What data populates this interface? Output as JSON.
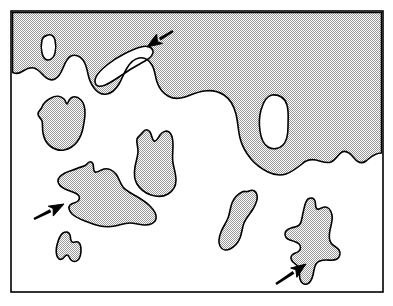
{
  "figure": {
    "domain": "Diagram",
    "canvas": {
      "width": 393,
      "height": 306
    },
    "frame": {
      "name": "plot-border",
      "x": 11,
      "y": 11,
      "width": 372,
      "height": 281,
      "stroke_color": "#000000",
      "stroke_width": 1.6,
      "fill_color": "#ffffff"
    },
    "style": {
      "fill_label": "halftone-stipple-50",
      "fill_base_color": "#d9d9d9",
      "fill_dot_color": "#8c8c8c",
      "fill_dot_period_px": 2,
      "outline_color": "#000000",
      "outline_width": 1.6,
      "background_color": "#ffffff",
      "arrow_color": "#000000"
    },
    "legend_text": "",
    "title": "",
    "caption": "",
    "axis_labels": [],
    "tick_labels": []
  },
  "shapes": {
    "mainland": {
      "name": "mainland-region",
      "label": "Upper stippled region with wavy southern boundary",
      "filled": true,
      "path": "M 12.5,12.5 L 381.5,12.5 L 381.5,153 C 374,153 370,158 366,161 C 362,164 358,163 354,158 C 350,153 346,150 342,152 C 338,154 336,160 331,162 C 326,164 321,161 316,160 C 311,159 306,160 302,164 C 297,168 292,172 286,174 C 280,176 274,175 268,172 C 262,169 256,165 251,159 C 246,153 242,146 240,138 C 238,130 238,122 236,114 C 234,106 230,99 224,95 C 218,91 211,90 204,91 C 197,92 191,95 185,97 C 179,99 173,99 168,96 C 163,93 159,88 157,82 C 155,76 155,70 152,65 C 149,60 144,57 139,58 C 134,59 130,63 127,68 C 124,73 122,79 119,84 C 116,89 112,93 107,94 C 102,95 97,92 94,88 C 91,84 89,79 88,74 C 87,69 86,64 83,60 C 80,56 75,54 71,56 C 67,58 65,63 63,68 C 61,73 59,77 55,79 C 51,81 47,79 44,76 C 41,73 38,69 34,68 C 30,67 26,69 23,71 C 20,73 17,74 14,73 C 13,72.6 12.7,72.3 12.5,72 Z"
    },
    "inclusion_small_top_left": {
      "name": "white-inclusion-small",
      "label": "Small white inclusion near top left",
      "filled": false,
      "path": "M 48,35 C 51,34 54,36 55,40 C 56,44 56,49 55,53 C 54,57 51,60 48,60 C 45,60 43,57 42,53 C 41,49 41,44 42,40 C 43,36 45,36 48,35 Z"
    },
    "inclusion_bay": {
      "name": "white-inclusion-bay",
      "label": "Elongated white bay inclusion in upper middle (annotated by arrow 1)",
      "filled": false,
      "path": "M 141,47 C 147,45 152,47 153,51 C 154,55 150,58 145,61 C 140,64 134,67 128,71 C 122,75 116,79 111,82 C 106,85 101,87 98,86 C 95,85 94,81 96,77 C 98,73 102,69 107,65 C 112,61 118,57 124,54 C 130,51 136,48 141,47 Z"
    },
    "inclusion_oval_right": {
      "name": "white-inclusion-oval",
      "label": "Oval white inclusion on right side of stippled region",
      "filled": false,
      "path": "M 272,95 C 279,94 285,98 287,105 C 289,112 288,120 288,127 C 288,134 287,141 283,145 C 279,149 273,150 268,147 C 263,144 261,138 260,131 C 259,124 259,117 261,110 C 263,103 266,96 272,95 Z"
    },
    "island_left_upper": {
      "name": "island-left-upper",
      "label": "Blob island at left with small notch on top",
      "filled": true,
      "path": "M 51,98 C 56,95 61,96 64,99 C 66,101 66,104 67,104 C 68,104 68,100 71,98 C 74,96 78,97 81,100 C 84,103 85,108 85,113 C 85,118 84,123 83,128 C 82,133 80,138 77,142 C 74,146 69,149 64,150 C 59,151 54,149 50,146 C 46,143 44,138 43,133 C 42,128 43,124 42,121 C 41,118 38,117 38,114 C 38,111 41,110 42,107 C 43,104 45,101 51,98 Z"
    },
    "island_center_guitar": {
      "name": "island-center-guitar",
      "label": "Guitar-shaped island in centre with two prongs on top",
      "filled": true,
      "path": "M 143,132 C 145,129 148,129 150,132 C 152,135 152,140 154,141 C 156,142 158,138 160,135 C 162,132 166,130 169,132 C 172,134 173,139 173,145 C 173,151 172,157 173,163 C 174,169 176,174 176,180 C 176,186 173,191 168,194 C 163,197 157,197 151,195 C 145,193 140,189 137,184 C 134,179 134,173 135,167 C 136,161 138,156 138,151 C 138,146 136,142 137,139 C 138,136 141,135 143,132 Z"
    },
    "island_large_center_left": {
      "name": "island-large-center-left",
      "label": "Large elongated island with pointed peak and deep west notch (annotated by arrow 2)",
      "filled": true,
      "path": "M 87,164 C 89,161 92,161 93,164 C 94,167 93,171 95,172 C 97,173 100,170 104,169 C 108,168 113,170 116,174 C 119,178 120,183 123,187 C 126,191 131,193 136,196 C 141,199 146,202 150,206 C 154,210 157,215 156,219 C 155,223 150,225 145,225 C 140,225 135,223 130,223 C 125,223 120,225 115,226 C 110,227 105,227 100,226 C 95,225 90,223 85,221 C 80,219 75,217 72,214 C 69,211 68,207 70,205 C 72,203 76,203 78,201 C 80,199 80,196 77,194 C 74,192 69,191 65,189 C 61,187 58,184 58,181 C 58,178 61,175 65,173 C 69,171 74,170 78,168 C 82,166 85,167 87,164 Z"
    },
    "island_small_a": {
      "name": "island-small-a-shaped",
      "label": "Small A-shaped island lower left",
      "filled": true,
      "path": "M 63,233 C 66,231 69,232 70,235 C 71,238 70,241 72,242 C 74,243 76,241 78,242 C 80,243 81,246 81,250 C 81,254 80,258 78,260 C 76,262 73,262 71,260 C 69,258 69,255 67,255 C 65,255 64,258 62,259 C 60,260 58,259 57,256 C 56,253 56,249 57,245 C 58,241 60,235 63,233 Z"
    },
    "island_s_curve": {
      "name": "island-s-curve",
      "label": "S-curved elongated island lower right of centre",
      "filled": true,
      "path": "M 249,191 C 253,189 256,191 257,195 C 258,199 256,204 253,209 C 250,214 246,218 244,223 C 242,228 242,233 240,238 C 238,243 234,247 230,249 C 226,251 222,250 220,246 C 218,242 219,237 221,232 C 223,227 226,223 228,218 C 230,213 230,208 232,203 C 234,198 238,194 242,192 C 246,190 245,193 249,191 Z"
    },
    "island_anchor": {
      "name": "island-anchor-shaped",
      "label": "Cross/anchor-shaped island at lower right with narrow neck (annotated by arrow 3)",
      "filled": true,
      "path": "M 308,199 C 311,197 314,198 315,201 C 316,204 315,208 317,209 C 319,210 322,207 325,207 C 328,207 331,210 332,215 C 333,220 331,225 330,230 C 329,235 329,240 331,243 C 333,246 337,247 339,250 C 341,253 340,257 337,259 C 334,261 330,260 326,260 C 322,260 318,261 316,264 C 314,267 314,271 313,275 C 312,279 310,283 307,284 C 304,285 301,283 300,279 C 299,275 300,271 299,268 C 298,265 295,264 293,262 C 291,260 290,257 292,255 C 294,253 297,253 299,251 C 301,249 301,246 299,244 C 297,242 293,241 290,240 C 287,239 285,237 285,234 C 285,231 288,229 291,228 C 294,227 298,227 300,224 C 302,221 302,217 303,213 C 304,209 305,201 308,199 Z"
    }
  },
  "annotations": {
    "arrows": [
      {
        "id": "arrow-1",
        "name": "annotation-arrow-top",
        "label": "Arrow 1",
        "direction": "down-left",
        "tail": {
          "x": 173,
          "y": 31
        },
        "head": {
          "x": 147,
          "y": 47
        },
        "shaft_width": 3.2,
        "head_length": 15,
        "head_width": 12,
        "points_at": "white-inclusion-bay"
      },
      {
        "id": "arrow-2",
        "name": "annotation-arrow-left",
        "label": "Arrow 2",
        "direction": "up-right",
        "tail": {
          "x": 34,
          "y": 219
        },
        "head": {
          "x": 64,
          "y": 204
        },
        "shaft_width": 3.2,
        "head_length": 15,
        "head_width": 12,
        "points_at": "island-large-center-left"
      },
      {
        "id": "arrow-3",
        "name": "annotation-arrow-bottom-right",
        "label": "Arrow 3",
        "direction": "up-right",
        "tail": {
          "x": 276,
          "y": 284
        },
        "head": {
          "x": 306,
          "y": 264
        },
        "shaft_width": 3.2,
        "head_length": 15,
        "head_width": 12,
        "points_at": "island-anchor-shaped"
      }
    ]
  }
}
